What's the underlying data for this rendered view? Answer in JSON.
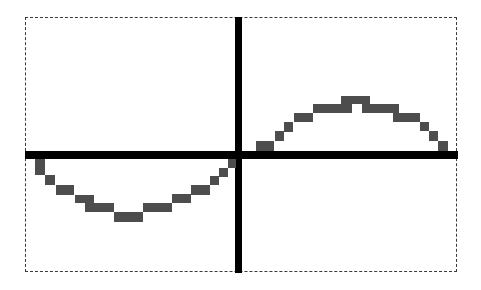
{
  "chart_data": {
    "type": "line",
    "title": "",
    "xlabel": "",
    "ylabel": "",
    "grid": false,
    "legend": null,
    "series": [
      {
        "name": "y = sin(x)",
        "x": [
          -6.28,
          -5.5,
          -4.71,
          -3.93,
          -3.14,
          -2.36,
          -1.57,
          -0.79,
          0,
          0.79,
          1.57,
          2.36,
          3.14
        ],
        "values": [
          0,
          -0.71,
          -1,
          -0.71,
          0,
          0.71,
          1,
          0.71,
          0,
          -0.71,
          -1,
          -0.71,
          0
        ]
      }
    ],
    "visible_series": {
      "left_half": "trough (values below x-axis, minimum near x = -pi/2)",
      "right_half": "crest (values above x-axis, maximum near x = pi/2)"
    },
    "axes": {
      "x_axis_visible": true,
      "y_axis_visible": true,
      "ticks": []
    }
  },
  "colors": {
    "background": "#ffffff",
    "axes": "#000000",
    "curve": "#4d4d4d",
    "frame": "#3a3a3a"
  },
  "frame": {
    "style": "dashed"
  },
  "pixels": [
    [
      256,
      141,
      18,
      10
    ],
    [
      275,
      131,
      9,
      10
    ],
    [
      284,
      122,
      9,
      10
    ],
    [
      294,
      113,
      19,
      9
    ],
    [
      313,
      104,
      28,
      9
    ],
    [
      341,
      96,
      11,
      9
    ],
    [
      352,
      96,
      10,
      8
    ],
    [
      362,
      96,
      8,
      9
    ],
    [
      341,
      104,
      11,
      9
    ],
    [
      362,
      104,
      37,
      9
    ],
    [
      393,
      113,
      27,
      9
    ],
    [
      420,
      122,
      9,
      9
    ],
    [
      429,
      131,
      9,
      10
    ],
    [
      438,
      141,
      10,
      10
    ],
    [
      35,
      159,
      10,
      16
    ],
    [
      45,
      175,
      10,
      10
    ],
    [
      56,
      185,
      18,
      10
    ],
    [
      75,
      195,
      19,
      8
    ],
    [
      85,
      203,
      29,
      9
    ],
    [
      114,
      212,
      29,
      10
    ],
    [
      143,
      203,
      29,
      9
    ],
    [
      172,
      194,
      19,
      9
    ],
    [
      191,
      185,
      19,
      10
    ],
    [
      210,
      176,
      9,
      9
    ],
    [
      219,
      168,
      9,
      9
    ],
    [
      228,
      159,
      8,
      9
    ]
  ]
}
